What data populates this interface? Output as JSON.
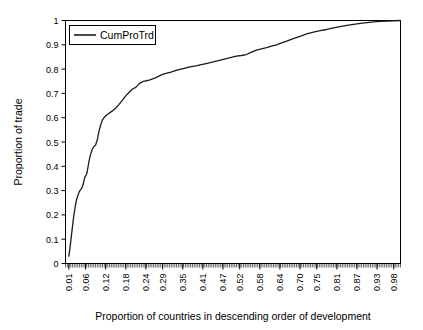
{
  "chart_data": {
    "type": "line",
    "title": "",
    "xlabel": "Proportion of countries in descending order of development",
    "ylabel": "Proportion of trade",
    "xlim": [
      0.0,
      1.0
    ],
    "ylim": [
      0.0,
      1.0
    ],
    "grid": false,
    "legend_position": "top-left",
    "legend": [
      "CumProTrd"
    ],
    "xtick_labels": [
      "0.01",
      "0.06",
      "0.12",
      "0.18",
      "0.24",
      "0.29",
      "0.35",
      "0.41",
      "0.47",
      "0.52",
      "0.58",
      "0.64",
      "0.70",
      "0.75",
      "0.81",
      "0.87",
      "0.93",
      "0.98"
    ],
    "xtick_values": [
      0.01,
      0.06,
      0.12,
      0.18,
      0.24,
      0.29,
      0.35,
      0.41,
      0.47,
      0.52,
      0.58,
      0.64,
      0.7,
      0.75,
      0.81,
      0.87,
      0.93,
      0.98
    ],
    "ytick_labels": [
      "0",
      "0.1",
      "0.2",
      "0.3",
      "0.4",
      "0.5",
      "0.6",
      "0.7",
      "0.8",
      "0.9",
      "1"
    ],
    "ytick_values": [
      0,
      0.1,
      0.2,
      0.3,
      0.4,
      0.5,
      0.6,
      0.7,
      0.8,
      0.9,
      1.0
    ],
    "minor_tick_count": 190,
    "series": [
      {
        "name": "CumProTrd",
        "color": "#1a1a1a",
        "x": [
          0.01,
          0.013,
          0.016,
          0.019,
          0.022,
          0.025,
          0.028,
          0.031,
          0.034,
          0.037,
          0.04,
          0.043,
          0.046,
          0.049,
          0.052,
          0.055,
          0.058,
          0.061,
          0.064,
          0.067,
          0.07,
          0.075,
          0.08,
          0.085,
          0.09,
          0.095,
          0.1,
          0.105,
          0.11,
          0.115,
          0.12,
          0.13,
          0.14,
          0.15,
          0.16,
          0.17,
          0.18,
          0.19,
          0.2,
          0.21,
          0.22,
          0.23,
          0.24,
          0.25,
          0.26,
          0.27,
          0.28,
          0.29,
          0.3,
          0.315,
          0.33,
          0.345,
          0.36,
          0.375,
          0.39,
          0.405,
          0.42,
          0.435,
          0.45,
          0.465,
          0.48,
          0.495,
          0.51,
          0.525,
          0.54,
          0.555,
          0.57,
          0.585,
          0.6,
          0.615,
          0.63,
          0.645,
          0.66,
          0.68,
          0.7,
          0.72,
          0.74,
          0.76,
          0.78,
          0.8,
          0.82,
          0.84,
          0.86,
          0.88,
          0.9,
          0.92,
          0.94,
          0.96,
          0.98,
          1.0
        ],
        "y": [
          0.03,
          0.06,
          0.095,
          0.13,
          0.165,
          0.2,
          0.225,
          0.25,
          0.268,
          0.28,
          0.292,
          0.3,
          0.305,
          0.312,
          0.322,
          0.34,
          0.356,
          0.362,
          0.372,
          0.395,
          0.42,
          0.45,
          0.47,
          0.482,
          0.488,
          0.51,
          0.545,
          0.57,
          0.59,
          0.6,
          0.608,
          0.618,
          0.628,
          0.64,
          0.655,
          0.672,
          0.69,
          0.705,
          0.718,
          0.725,
          0.74,
          0.748,
          0.752,
          0.755,
          0.76,
          0.765,
          0.772,
          0.778,
          0.782,
          0.788,
          0.795,
          0.8,
          0.805,
          0.81,
          0.813,
          0.818,
          0.823,
          0.828,
          0.833,
          0.838,
          0.843,
          0.848,
          0.853,
          0.856,
          0.86,
          0.87,
          0.878,
          0.883,
          0.888,
          0.895,
          0.9,
          0.908,
          0.915,
          0.925,
          0.935,
          0.945,
          0.952,
          0.958,
          0.963,
          0.97,
          0.975,
          0.98,
          0.984,
          0.988,
          0.991,
          0.994,
          0.996,
          0.998,
          0.999,
          1.0
        ]
      }
    ]
  }
}
